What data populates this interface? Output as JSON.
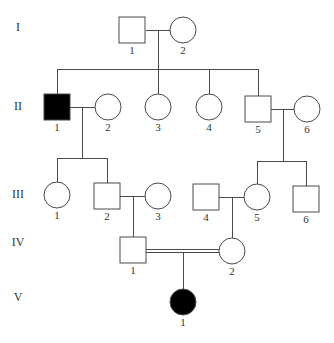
{
  "chart_data": {
    "type": "pedigree",
    "title": "",
    "colors": {
      "line": "#4a4a4a",
      "affected": "#000000",
      "unaffected": "#ffffff",
      "text": "#333333"
    },
    "generations": [
      {
        "label": "I",
        "y": 31
      },
      {
        "label": "II",
        "y": 110
      },
      {
        "label": "III",
        "y": 198
      },
      {
        "label": "IV",
        "y": 246
      },
      {
        "label": "V",
        "y": 301
      }
    ],
    "individuals": [
      {
        "id": "I-1",
        "gen": "I",
        "num": "1",
        "sex": "male",
        "affected": false,
        "x": 132,
        "y": 30
      },
      {
        "id": "I-2",
        "gen": "I",
        "num": "2",
        "sex": "female",
        "affected": false,
        "x": 183,
        "y": 30
      },
      {
        "id": "II-1",
        "gen": "II",
        "num": "1",
        "sex": "male",
        "affected": true,
        "x": 57,
        "y": 107
      },
      {
        "id": "II-2",
        "gen": "II",
        "num": "2",
        "sex": "female",
        "affected": false,
        "x": 108,
        "y": 107
      },
      {
        "id": "II-3",
        "gen": "II",
        "num": "3",
        "sex": "female",
        "affected": false,
        "x": 158,
        "y": 107
      },
      {
        "id": "II-4",
        "gen": "II",
        "num": "4",
        "sex": "female",
        "affected": false,
        "x": 209,
        "y": 107
      },
      {
        "id": "II-5",
        "gen": "II",
        "num": "5",
        "sex": "male",
        "affected": false,
        "x": 258,
        "y": 109
      },
      {
        "id": "II-6",
        "gen": "II",
        "num": "6",
        "sex": "female",
        "affected": false,
        "x": 307,
        "y": 109
      },
      {
        "id": "III-1",
        "gen": "III",
        "num": "1",
        "sex": "female",
        "affected": false,
        "x": 57,
        "y": 195
      },
      {
        "id": "III-2",
        "gen": "III",
        "num": "2",
        "sex": "male",
        "affected": false,
        "x": 107,
        "y": 196
      },
      {
        "id": "III-3",
        "gen": "III",
        "num": "3",
        "sex": "female",
        "affected": false,
        "x": 158,
        "y": 196
      },
      {
        "id": "III-4",
        "gen": "III",
        "num": "4",
        "sex": "male",
        "affected": false,
        "x": 206,
        "y": 197
      },
      {
        "id": "III-5",
        "gen": "III",
        "num": "5",
        "sex": "female",
        "affected": false,
        "x": 257,
        "y": 197
      },
      {
        "id": "III-6",
        "gen": "III",
        "num": "6",
        "sex": "male",
        "affected": false,
        "x": 306,
        "y": 199
      },
      {
        "id": "IV-1",
        "gen": "IV",
        "num": "1",
        "sex": "male",
        "affected": false,
        "x": 133,
        "y": 250
      },
      {
        "id": "IV-2",
        "gen": "IV",
        "num": "2",
        "sex": "female",
        "affected": false,
        "x": 232,
        "y": 251
      },
      {
        "id": "V-1",
        "gen": "V",
        "num": "1",
        "sex": "female",
        "affected": true,
        "x": 183,
        "y": 302
      }
    ],
    "lines": [
      {
        "name": "marriage-I1-I2",
        "x1": 146,
        "y1": 30,
        "x2": 170,
        "y2": 30
      },
      {
        "name": "descent-I",
        "x1": 158,
        "y1": 30,
        "x2": 158,
        "y2": 69
      },
      {
        "name": "sibship-II",
        "x1": 57,
        "y1": 69,
        "x2": 258,
        "y2": 69
      },
      {
        "name": "drop-II1",
        "x1": 57,
        "y1": 69,
        "x2": 57,
        "y2": 94
      },
      {
        "name": "drop-II3",
        "x1": 158,
        "y1": 69,
        "x2": 158,
        "y2": 94
      },
      {
        "name": "drop-II4",
        "x1": 209,
        "y1": 69,
        "x2": 209,
        "y2": 94
      },
      {
        "name": "drop-II5",
        "x1": 258,
        "y1": 69,
        "x2": 258,
        "y2": 96
      },
      {
        "name": "marriage-II1-II2",
        "x1": 70,
        "y1": 107,
        "x2": 95,
        "y2": 107
      },
      {
        "name": "descent-II1",
        "x1": 82,
        "y1": 107,
        "x2": 82,
        "y2": 158
      },
      {
        "name": "marriage-II5-II6",
        "x1": 271,
        "y1": 109,
        "x2": 294,
        "y2": 109
      },
      {
        "name": "descent-II5",
        "x1": 283,
        "y1": 109,
        "x2": 283,
        "y2": 161
      },
      {
        "name": "sibship-III-left",
        "x1": 57,
        "y1": 158,
        "x2": 107,
        "y2": 158
      },
      {
        "name": "drop-III1",
        "x1": 57,
        "y1": 158,
        "x2": 57,
        "y2": 182
      },
      {
        "name": "drop-III2",
        "x1": 107,
        "y1": 158,
        "x2": 107,
        "y2": 183
      },
      {
        "name": "sibship-III-right",
        "x1": 257,
        "y1": 161,
        "x2": 306,
        "y2": 161
      },
      {
        "name": "drop-III5",
        "x1": 257,
        "y1": 161,
        "x2": 257,
        "y2": 184
      },
      {
        "name": "drop-III6",
        "x1": 306,
        "y1": 161,
        "x2": 306,
        "y2": 186
      },
      {
        "name": "marriage-III2-III3",
        "x1": 120,
        "y1": 196,
        "x2": 145,
        "y2": 196
      },
      {
        "name": "descent-III2",
        "x1": 133,
        "y1": 196,
        "x2": 133,
        "y2": 237
      },
      {
        "name": "marriage-III4-III5",
        "x1": 219,
        "y1": 197,
        "x2": 244,
        "y2": 197
      },
      {
        "name": "descent-III4",
        "x1": 232,
        "y1": 197,
        "x2": 232,
        "y2": 238
      },
      {
        "name": "consanguineous-top",
        "x1": 146,
        "y1": 249,
        "x2": 219,
        "y2": 249
      },
      {
        "name": "consanguineous-bottom",
        "x1": 146,
        "y1": 252,
        "x2": 219,
        "y2": 252
      },
      {
        "name": "descent-IV",
        "x1": 183,
        "y1": 252,
        "x2": 183,
        "y2": 289
      }
    ],
    "size": {
      "square": 26,
      "circle_r": 13,
      "label_offset": 24
    },
    "legend": []
  }
}
